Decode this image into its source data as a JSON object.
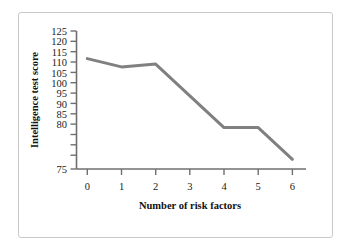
{
  "chart_data": {
    "type": "line",
    "title": "",
    "xlabel": "Number of risk factors",
    "ylabel": "Intelligence test score",
    "x": [
      0,
      1,
      2,
      3,
      4,
      5,
      6
    ],
    "values": [
      115,
      112,
      113,
      101.5,
      90,
      90,
      78.5
    ],
    "series": [
      {
        "name": "Intelligence test score",
        "values": [
          115,
          112,
          113,
          101.5,
          90,
          90,
          78.5
        ]
      }
    ],
    "xlim": [
      0,
      6
    ],
    "ylim": [
      75,
      125
    ],
    "xticks": [
      0,
      1,
      2,
      3,
      4,
      5,
      6
    ],
    "yticks": [
      75,
      80,
      85,
      90,
      95,
      100,
      105,
      110,
      115,
      120,
      125
    ],
    "xtick_labels": [
      "0",
      "1",
      "2",
      "3",
      "4",
      "5",
      "6"
    ],
    "ytick_labels": [
      "75",
      "80",
      "85",
      "90",
      "95",
      "100",
      "105",
      "110",
      "115",
      "120",
      "125"
    ],
    "grid": false,
    "legend": false,
    "line_color": "#808080",
    "axis_color": "#6f6f6f",
    "text_color": "#111111",
    "background_color": "#ffffff",
    "border_color": "#c9c9c9",
    "line_width": 3
  }
}
